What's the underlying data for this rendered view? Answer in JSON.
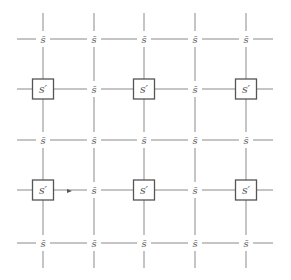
{
  "diagram": {
    "title": "",
    "type": "lattice-grid",
    "colors": {
      "line": "#8a8a8a",
      "box_stroke": "#555555",
      "text": "#555555",
      "background": "#ffffff"
    },
    "grid": {
      "columns_x": [
        43,
        94,
        144,
        195,
        246
      ],
      "rows_y": [
        39,
        89,
        140,
        190,
        243
      ],
      "line_extent": {
        "x_min": 17,
        "x_max": 273,
        "y_min": 13,
        "y_max": 268
      }
    },
    "labels": {
      "sbar": "s̄",
      "sprime": "s′"
    },
    "nodes": [
      {
        "row": 0,
        "col": 0,
        "kind": "sbar"
      },
      {
        "row": 0,
        "col": 1,
        "kind": "sbar"
      },
      {
        "row": 0,
        "col": 2,
        "kind": "sbar"
      },
      {
        "row": 0,
        "col": 3,
        "kind": "sbar"
      },
      {
        "row": 0,
        "col": 4,
        "kind": "sbar"
      },
      {
        "row": 1,
        "col": 0,
        "kind": "sprime"
      },
      {
        "row": 1,
        "col": 1,
        "kind": "sbar"
      },
      {
        "row": 1,
        "col": 2,
        "kind": "sprime"
      },
      {
        "row": 1,
        "col": 3,
        "kind": "sbar"
      },
      {
        "row": 1,
        "col": 4,
        "kind": "sprime"
      },
      {
        "row": 2,
        "col": 0,
        "kind": "sbar"
      },
      {
        "row": 2,
        "col": 1,
        "kind": "sbar"
      },
      {
        "row": 2,
        "col": 2,
        "kind": "sbar"
      },
      {
        "row": 2,
        "col": 3,
        "kind": "sbar"
      },
      {
        "row": 2,
        "col": 4,
        "kind": "sbar"
      },
      {
        "row": 3,
        "col": 0,
        "kind": "sprime"
      },
      {
        "row": 3,
        "col": 1,
        "kind": "sbar"
      },
      {
        "row": 3,
        "col": 2,
        "kind": "sprime"
      },
      {
        "row": 3,
        "col": 3,
        "kind": "sbar"
      },
      {
        "row": 3,
        "col": 4,
        "kind": "sprime"
      },
      {
        "row": 4,
        "col": 0,
        "kind": "sbar"
      },
      {
        "row": 4,
        "col": 1,
        "kind": "sbar"
      },
      {
        "row": 4,
        "col": 2,
        "kind": "sbar"
      },
      {
        "row": 4,
        "col": 3,
        "kind": "sbar"
      },
      {
        "row": 4,
        "col": 4,
        "kind": "sbar"
      }
    ],
    "arrow": {
      "x": 70,
      "y": 191,
      "direction": "right"
    }
  }
}
